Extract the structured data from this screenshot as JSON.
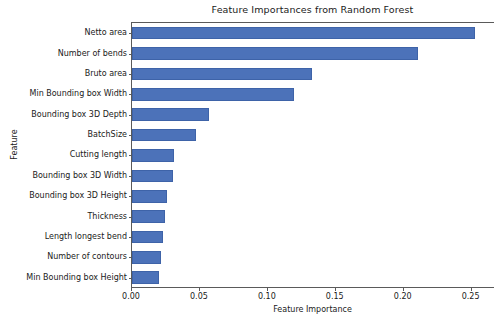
{
  "chart_data": {
    "type": "bar",
    "orientation": "horizontal",
    "title": "Feature Importances from Random Forest",
    "xlabel": "Feature Importance",
    "ylabel": "Feature",
    "xlim": [
      0.0,
      0.2672
    ],
    "grid": false,
    "legend": null,
    "bar_color": "#4c72b9",
    "xticks": [
      0.0,
      0.05,
      0.1,
      0.15,
      0.2,
      0.25
    ],
    "xtick_labels": [
      "0.00",
      "0.05",
      "0.10",
      "0.15",
      "0.20",
      "0.25"
    ],
    "categories": [
      "Netto area",
      "Number of bends",
      "Bruto area",
      "Min Bounding box Width",
      "Bounding box 3D Depth",
      "BatchSize",
      "Cutting length",
      "Bounding box 3D Width",
      "Bounding box 3D Height",
      "Thickness",
      "Length longest bend",
      "Number of contours",
      "Min Bounding box Height"
    ],
    "values": [
      0.2525,
      0.2105,
      0.1325,
      0.119,
      0.0565,
      0.047,
      0.031,
      0.0305,
      0.026,
      0.0245,
      0.023,
      0.0215,
      0.02
    ]
  }
}
